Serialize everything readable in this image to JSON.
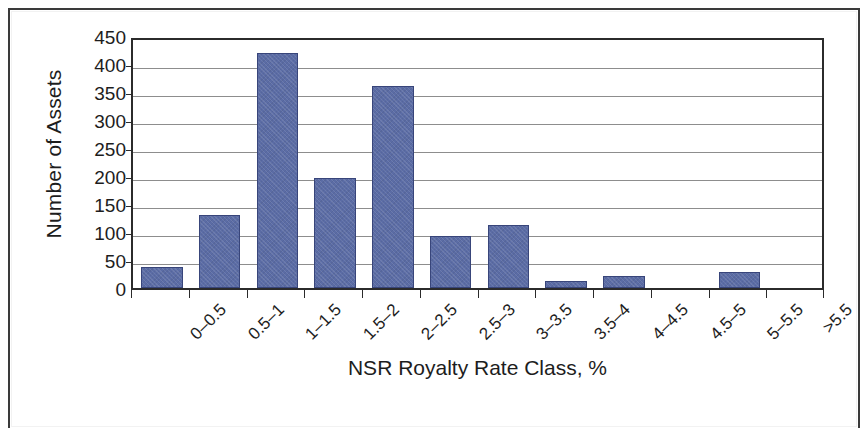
{
  "chart_data": {
    "type": "bar",
    "title": "",
    "subtitle": "",
    "xlabel": "NSR  Royalty Rate Class, %",
    "ylabel": "Number of Assets",
    "categories": [
      "0–0.5",
      "0.5–1",
      "1–1.5",
      "1.5–2",
      "2–2.5",
      "2.5–3",
      "3–3.5",
      "3.5–4",
      "4–4.5",
      "4.5–5",
      "5–5.5",
      ">5.5"
    ],
    "values": [
      38,
      130,
      420,
      197,
      361,
      93,
      113,
      12,
      22,
      0,
      29,
      0
    ],
    "ylim": [
      0,
      450
    ],
    "ytick_step": 50,
    "yticks": [
      "450",
      "400",
      "350",
      "300",
      "250",
      "200",
      "150",
      "100",
      "50",
      "0"
    ],
    "ytick_values": [
      450,
      400,
      350,
      300,
      250,
      200,
      150,
      100,
      50,
      0
    ],
    "grid": true,
    "grid_axis": "y",
    "legend": false,
    "legend_position": "none",
    "bar_color": "#5b6ca5",
    "bar_edge_color": "#38457a",
    "axis_color": "#2b2b2b",
    "gridline_color": "#8d8d8d",
    "text_color": "#1d1d1d",
    "background_color": "#ffffff",
    "xtick_label_rotation": -45,
    "series": [
      {
        "name": "Number of Assets",
        "values": [
          38,
          130,
          420,
          197,
          361,
          93,
          113,
          12,
          22,
          0,
          29,
          0
        ]
      }
    ]
  }
}
